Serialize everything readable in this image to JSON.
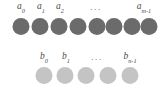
{
  "figure": {
    "type": "diagram",
    "background_color": "#ffffff",
    "width": 161,
    "height": 97
  },
  "rows": [
    {
      "id": "row-a",
      "name": "sequence-a",
      "node_count": 8,
      "node_color": "#6b6b6b",
      "node_diameter": 17,
      "labels": [
        {
          "base": "a",
          "subscript": "0",
          "center_x": 21,
          "target_index": 0
        },
        {
          "base": "a",
          "subscript": "1",
          "center_x": 41,
          "target_index": 1
        },
        {
          "base": "a",
          "subscript": "2",
          "center_x": 60,
          "target_index": 2
        },
        {
          "base": "a",
          "subscript": "m-1",
          "center_x": 144,
          "target_index": 7
        }
      ],
      "ellipsis": {
        "text": "...",
        "center_x": 96
      },
      "node_centers_x": [
        21,
        40,
        59,
        78,
        97,
        114,
        132,
        149
      ]
    },
    {
      "id": "row-b",
      "name": "sequence-b",
      "node_count": 5,
      "node_color": "#c4c4c4",
      "node_diameter": 17,
      "labels": [
        {
          "base": "b",
          "subscript": "0",
          "center_x": 44,
          "target_index": 0
        },
        {
          "base": "b",
          "subscript": "1",
          "center_x": 66,
          "target_index": 1
        },
        {
          "base": "b",
          "subscript": "n-1",
          "center_x": 130,
          "target_index": 4
        }
      ],
      "ellipsis": {
        "text": "...",
        "center_x": 97
      },
      "node_centers_x": [
        44,
        65,
        86,
        108,
        130
      ]
    }
  ]
}
